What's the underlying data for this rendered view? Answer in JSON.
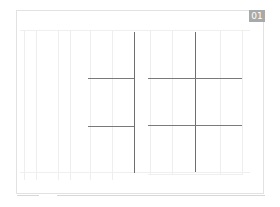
{
  "page": {
    "badge": "01",
    "colors": {
      "badge_bg": "#a9a9a9",
      "badge_text": "#ffffff",
      "line": "#6e6e6e",
      "faint": "#eeeeee"
    }
  },
  "layout": {
    "panels": [
      "left-panel",
      "right-panel"
    ],
    "grid_lines": {
      "vertical": [
        134,
        195
      ],
      "horizontal": [
        78,
        126
      ]
    }
  }
}
